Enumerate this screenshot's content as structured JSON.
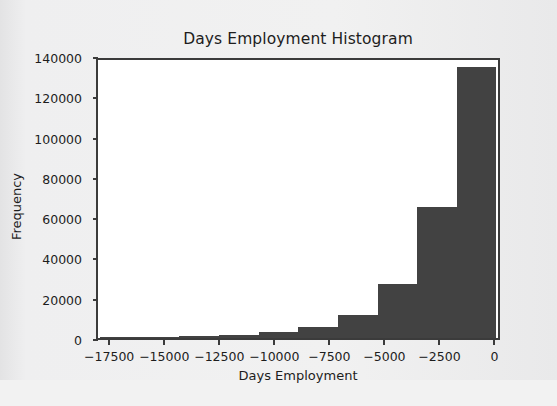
{
  "figure": {
    "background_color": "#ececed",
    "plot_background_color": "#ffffff",
    "axis_color": "#3b3b3b",
    "bar_color": "#424242"
  },
  "chart_data": {
    "type": "bar",
    "title": "Days Employment Histogram",
    "xlabel": "Days Employment",
    "ylabel": "Frequency",
    "grid": false,
    "legend": null,
    "xlim": [
      -18100,
      250
    ],
    "ylim": [
      0,
      140000
    ],
    "xticks": [
      -17500,
      -15000,
      -12500,
      -10000,
      -7500,
      -5000,
      -2500,
      0
    ],
    "xtick_labels": [
      "−17500",
      "−15000",
      "−12500",
      "−10000",
      "−7500",
      "−5000",
      "−2500",
      "0"
    ],
    "yticks": [
      0,
      20000,
      40000,
      60000,
      80000,
      100000,
      120000,
      140000
    ],
    "ytick_labels": [
      "0",
      "20000",
      "40000",
      "60000",
      "80000",
      "100000",
      "120000",
      "140000"
    ],
    "bin_edges": [
      -18000,
      -16200,
      -14400,
      -12600,
      -10800,
      -9000,
      -7200,
      -5400,
      -3600,
      -1800,
      0
    ],
    "categories": [
      "-18000 to -16200",
      "-16200 to -14400",
      "-14400 to -12600",
      "-12600 to -10800",
      "-10800 to -9000",
      "-9000 to -7200",
      "-7200 to -5400",
      "-5400 to -3600",
      "-3600 to -1800",
      "-1800 to 0"
    ],
    "values": [
      200,
      700,
      1200,
      1600,
      2800,
      5500,
      11500,
      27000,
      65000,
      134500
    ]
  }
}
